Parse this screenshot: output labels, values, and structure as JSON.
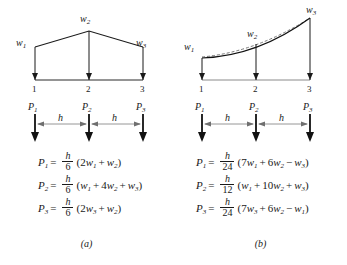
{
  "figure": {
    "panels": [
      {
        "id": "a",
        "caption": "(a)",
        "load_type": "piecewise-linear",
        "load_labels": [
          "w1",
          "w2",
          "w3"
        ],
        "load_label_text": {
          "w1": "w",
          "w1_sub": "1",
          "w2": "w",
          "w2_sub": "2",
          "w3": "w",
          "w3_sub": "3"
        },
        "node_labels": [
          "1",
          "2",
          "3"
        ],
        "force_labels": [
          {
            "base": "P",
            "sub": "1"
          },
          {
            "base": "P",
            "sub": "2"
          },
          {
            "base": "P",
            "sub": "3"
          }
        ],
        "spacing_labels": [
          "h",
          "h"
        ],
        "equations": [
          {
            "lhs": "P",
            "lhs_sub": "1",
            "equals": "=",
            "numerator": "h",
            "denominator": "6",
            "open": "(",
            "terms": [
              {
                "coef": "2",
                "var": "w",
                "sub": "1"
              },
              {
                "op": "+",
                "coef": "",
                "var": "w",
                "sub": "2"
              }
            ],
            "close": ")"
          },
          {
            "lhs": "P",
            "lhs_sub": "2",
            "equals": "=",
            "numerator": "h",
            "denominator": "6",
            "open": "(",
            "terms": [
              {
                "coef": "",
                "var": "w",
                "sub": "1"
              },
              {
                "op": "+",
                "coef": "4",
                "var": "w",
                "sub": "2"
              },
              {
                "op": "+",
                "coef": "",
                "var": "w",
                "sub": "3"
              }
            ],
            "close": ")"
          },
          {
            "lhs": "P",
            "lhs_sub": "3",
            "equals": "=",
            "numerator": "h",
            "denominator": "6",
            "open": "(",
            "terms": [
              {
                "coef": "2",
                "var": "w",
                "sub": "3"
              },
              {
                "op": "+",
                "coef": "",
                "var": "w",
                "sub": "2"
              }
            ],
            "close": ")"
          }
        ]
      },
      {
        "id": "b",
        "caption": "(b)",
        "load_type": "parabolic",
        "load_labels": [
          "w1",
          "w2",
          "w3"
        ],
        "node_labels": [
          "1",
          "2",
          "3"
        ],
        "force_labels": [
          {
            "base": "P",
            "sub": "1"
          },
          {
            "base": "P",
            "sub": "2"
          },
          {
            "base": "P",
            "sub": "3"
          }
        ],
        "spacing_labels": [
          "h",
          "h"
        ],
        "equations": [
          {
            "lhs": "P",
            "lhs_sub": "1",
            "equals": "=",
            "numerator": "h",
            "denominator": "24",
            "open": "(",
            "terms": [
              {
                "coef": "7",
                "var": "w",
                "sub": "1"
              },
              {
                "op": "+",
                "coef": "6",
                "var": "w",
                "sub": "2"
              },
              {
                "op": "−",
                "coef": "",
                "var": "w",
                "sub": "3"
              }
            ],
            "close": ")"
          },
          {
            "lhs": "P",
            "lhs_sub": "2",
            "equals": "=",
            "numerator": "h",
            "denominator": "12",
            "open": "(",
            "terms": [
              {
                "coef": "",
                "var": "w",
                "sub": "1"
              },
              {
                "op": "+",
                "coef": "10",
                "var": "w",
                "sub": "2"
              },
              {
                "op": "+",
                "coef": "",
                "var": "w",
                "sub": "3"
              }
            ],
            "close": ")"
          },
          {
            "lhs": "P",
            "lhs_sub": "3",
            "equals": "=",
            "numerator": "h",
            "denominator": "24",
            "open": "(",
            "terms": [
              {
                "coef": "7",
                "var": "w",
                "sub": "3"
              },
              {
                "op": "+",
                "coef": "6",
                "var": "w",
                "sub": "2"
              },
              {
                "op": "−",
                "coef": "",
                "var": "w",
                "sub": "1"
              }
            ],
            "close": ")"
          }
        ]
      }
    ],
    "colors": {
      "ink": "#1a1a1a",
      "rule": "#2b2b2b",
      "dimension": "#8a8a8a",
      "dashed": "#555555",
      "background": "#ffffff"
    }
  }
}
